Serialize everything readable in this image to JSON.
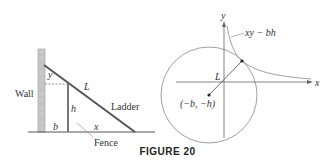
{
  "figure": {
    "caption": "FIGURE 20",
    "left_panel": {
      "wall_label": "Wall",
      "ladder_label": "Ladder",
      "fence_label": "Fence",
      "L_label": "L",
      "y_label": "y",
      "h_label": "h",
      "b_label": "b",
      "x_label": "x"
    },
    "right_panel": {
      "x_axis_label": "x",
      "y_axis_label": "y",
      "curve_label": "xy − bh",
      "L_label": "L",
      "point_label": "(−b, −h)"
    }
  },
  "colors": {
    "line": "#555555",
    "thin": "#888888",
    "wall": "#bbbbbb"
  }
}
